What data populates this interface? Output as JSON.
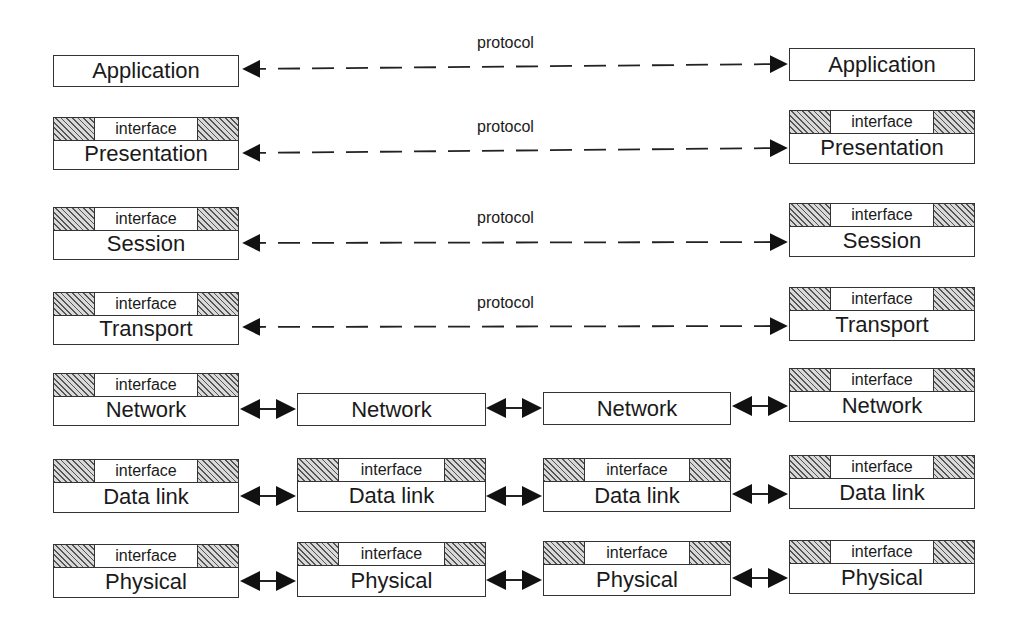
{
  "labels": {
    "interface": "interface",
    "protocol": "protocol"
  },
  "stack_left": [
    "Application",
    "Presentation",
    "Session",
    "Transport",
    "Network",
    "Data link",
    "Physical"
  ],
  "stack_right": [
    "Application",
    "Presentation",
    "Session",
    "Transport",
    "Network",
    "Data link",
    "Physical"
  ],
  "router1": [
    "Network",
    "Data link",
    "Physical"
  ],
  "router2": [
    "Network",
    "Data link",
    "Physical"
  ]
}
